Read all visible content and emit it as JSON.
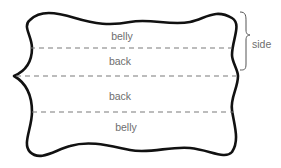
{
  "diagram": {
    "type": "hide-layout",
    "sections": [
      {
        "label": "belly"
      },
      {
        "label": "back"
      },
      {
        "label": "back"
      },
      {
        "label": "belly"
      }
    ],
    "bracket_label": "side",
    "colors": {
      "outline": "#111111",
      "dashes": "#7a7a7a",
      "text": "#6e6e6e",
      "background": "#ffffff"
    }
  }
}
